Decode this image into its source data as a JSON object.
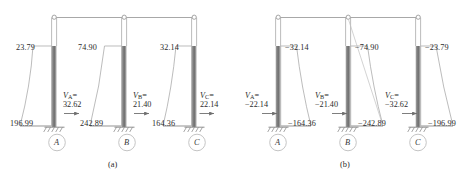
{
  "figure": {
    "panels": [
      {
        "id": "a",
        "caption": "(a)",
        "columns": [
          {
            "node": "A",
            "top_moment": "23.79",
            "base_moment": "196.99",
            "shear_symbol": "V",
            "shear_subscript": "A",
            "shear_equals": "=",
            "shear_value": "32.62",
            "arrow_direction": "right"
          },
          {
            "node": "B",
            "top_moment": "74.90",
            "base_moment": "242.89",
            "shear_symbol": "V",
            "shear_subscript": "B",
            "shear_equals": "=",
            "shear_value": "21.40",
            "arrow_direction": "right"
          },
          {
            "node": "C",
            "top_moment": "32.14",
            "base_moment": "164.36",
            "shear_symbol": "V",
            "shear_subscript": "C",
            "shear_equals": "=",
            "shear_value": "22.14",
            "arrow_direction": "right"
          }
        ]
      },
      {
        "id": "b",
        "caption": "(b)",
        "columns": [
          {
            "node": "A",
            "top_moment": "−32.14",
            "base_moment": "−164.36",
            "shear_symbol": "V",
            "shear_subscript": "A",
            "shear_equals": "=",
            "shear_value": "−22.14",
            "arrow_direction": "right"
          },
          {
            "node": "B",
            "top_moment": "−74.90",
            "base_moment": "−242.89",
            "shear_symbol": "V",
            "shear_subscript": "B",
            "shear_equals": "=",
            "shear_value": "−21.40",
            "arrow_direction": "right"
          },
          {
            "node": "C",
            "top_moment": "−23.79",
            "base_moment": "−196.99",
            "shear_symbol": "V",
            "shear_subscript": "C",
            "shear_equals": "=",
            "shear_value": "−32.62",
            "arrow_direction": "right"
          }
        ]
      }
    ],
    "colors": {
      "line": "#8d8d8d",
      "column_fill_dark": "#7a7a7a",
      "column_fill_light": "#b8b8b8",
      "text": "#2b2b2b",
      "background": "#ffffff"
    }
  }
}
